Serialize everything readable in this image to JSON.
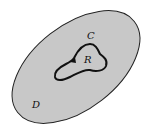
{
  "diagram": {
    "region_D": {
      "label": "D",
      "fill": "#c8c8c8",
      "stroke": "#222222"
    },
    "curve_C": {
      "label": "C",
      "stroke": "#111111",
      "orientation": "counterclockwise"
    },
    "region_R": {
      "label": "R"
    }
  }
}
